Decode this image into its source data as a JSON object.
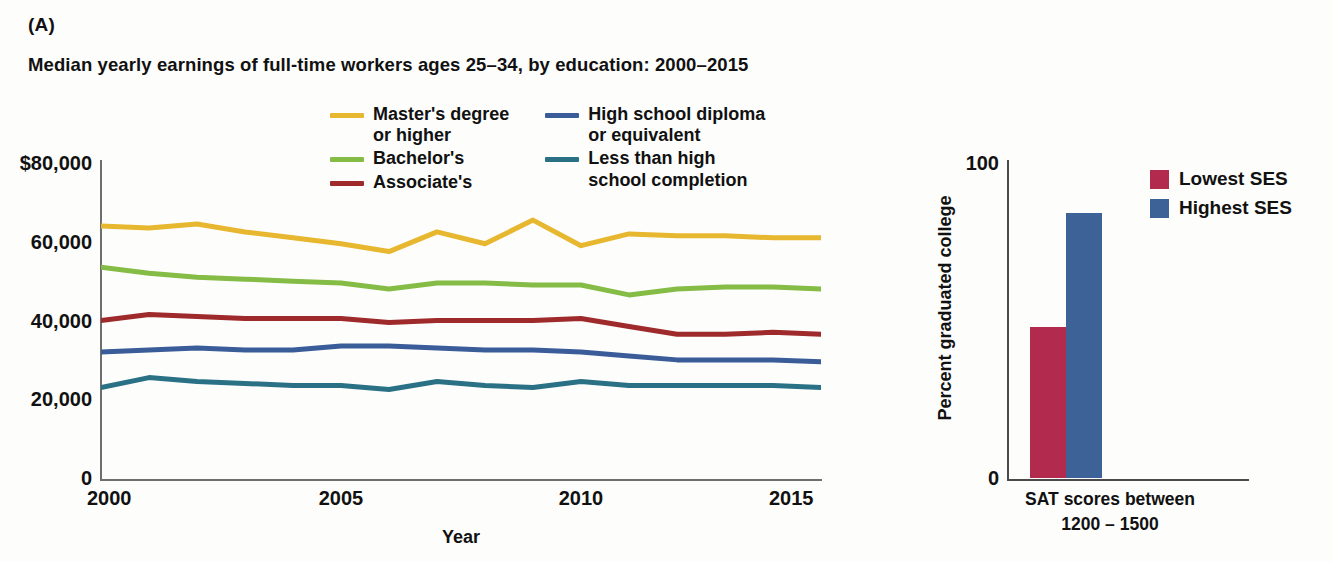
{
  "panels": {
    "a_label": "(A)",
    "b_label": "(B)"
  },
  "chart_data": [
    {
      "type": "line",
      "panel": "(A)",
      "title": "Median yearly earnings of full-time workers ages 25–34, by education: 2000–2015",
      "xlabel": "Year",
      "ylabel": "",
      "x": [
        2000,
        2001,
        2002,
        2003,
        2004,
        2005,
        2006,
        2007,
        2008,
        2009,
        2010,
        2011,
        2012,
        2013,
        2014,
        2015
      ],
      "xticks": [
        "2000",
        "2005",
        "2010",
        "2015"
      ],
      "xtick_values": [
        2000,
        2005,
        2010,
        2015
      ],
      "yticks": [
        "$80,000",
        "60,000",
        "40,000",
        "20,000",
        "0"
      ],
      "ytick_values": [
        80000,
        60000,
        40000,
        20000,
        0
      ],
      "ylim": [
        0,
        80000
      ],
      "xlim": [
        2000,
        2015
      ],
      "grid": false,
      "legend_position": "top-center",
      "series": [
        {
          "name": "Master's degree\nor higher",
          "legend_label": "Master's degree\nor higher",
          "color": "#E8B730",
          "values": [
            64000,
            63500,
            64500,
            62500,
            61000,
            59500,
            57500,
            62500,
            59500,
            65500,
            59000,
            62000,
            61500,
            61500,
            61000,
            61000
          ]
        },
        {
          "name": "Bachelor's",
          "legend_label": "Bachelor's",
          "color": "#84BC45",
          "values": [
            53500,
            52000,
            51000,
            50500,
            50000,
            49500,
            48000,
            49500,
            49500,
            49000,
            49000,
            46500,
            48000,
            48500,
            48500,
            48000
          ]
        },
        {
          "name": "Associate's",
          "legend_label": "Associate's",
          "color": "#9E2A2B",
          "values": [
            40000,
            41500,
            41000,
            40500,
            40500,
            40500,
            39500,
            40000,
            40000,
            40000,
            40500,
            38500,
            36500,
            36500,
            37000,
            36500
          ]
        },
        {
          "name": "High school diploma\nor equivalent",
          "legend_label": "High school diploma\nor equivalent",
          "color": "#3A5D99",
          "values": [
            32000,
            32500,
            33000,
            32500,
            32500,
            33500,
            33500,
            33000,
            32500,
            32500,
            32000,
            31000,
            30000,
            30000,
            30000,
            29500
          ]
        },
        {
          "name": "Less than high\nschool completion",
          "legend_label": "Less than high\nschool completion",
          "color": "#2A7186",
          "values": [
            23000,
            25500,
            24500,
            24000,
            23500,
            23500,
            22500,
            24500,
            23500,
            23000,
            24500,
            23500,
            23500,
            23500,
            23500,
            23000
          ]
        }
      ]
    },
    {
      "type": "bar",
      "panel": "(B)",
      "title": "",
      "xlabel": "SAT scores between\n1200 – 1500",
      "xlabel_line1": "SAT scores between",
      "xlabel_line2": "1200 – 1500",
      "ylabel": "Percent graduated college",
      "yticks": [
        "100",
        "0"
      ],
      "ytick_values": [
        100,
        0
      ],
      "ylim": [
        0,
        100
      ],
      "grid": false,
      "legend_position": "top-right",
      "categories": [
        "SAT scores between 1200 – 1500"
      ],
      "series": [
        {
          "name": "Lowest SES",
          "color": "#B22A4E",
          "values": [
            48
          ]
        },
        {
          "name": "Highest SES",
          "color": "#3C6297",
          "values": [
            84
          ]
        }
      ]
    }
  ]
}
